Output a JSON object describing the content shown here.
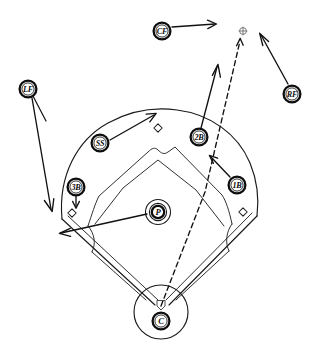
{
  "diagram": {
    "type": "baseball-field-play-diagram",
    "background_color": "#ffffff",
    "ink_color": "#111111",
    "ball_mark_color": "#6e6e6e"
  },
  "players": [
    {
      "id": "lf",
      "label": "LF",
      "x": 28,
      "y": 89,
      "r": 8.4,
      "name": "left-fielder"
    },
    {
      "id": "cf",
      "label": "CF",
      "x": 162,
      "y": 31,
      "r": 8.4,
      "name": "center-fielder"
    },
    {
      "id": "rf",
      "label": "RF",
      "x": 292,
      "y": 94,
      "r": 8.4,
      "name": "right-fielder"
    },
    {
      "id": "ss",
      "label": "SS",
      "x": 100,
      "y": 143,
      "r": 8.4,
      "name": "shortstop"
    },
    {
      "id": "2b",
      "label": "2B",
      "x": 199,
      "y": 137,
      "r": 8.4,
      "name": "second-baseman"
    },
    {
      "id": "3b",
      "label": "3B",
      "x": 76,
      "y": 187,
      "r": 8.4,
      "name": "third-baseman"
    },
    {
      "id": "1b",
      "label": "1B",
      "x": 237,
      "y": 185,
      "r": 8.4,
      "name": "first-baseman"
    },
    {
      "id": "p",
      "label": "P",
      "x": 158,
      "y": 212,
      "r": 8.0,
      "name": "pitcher"
    },
    {
      "id": "c",
      "label": "C",
      "x": 161,
      "y": 321,
      "r": 8.4,
      "name": "catcher"
    }
  ],
  "ball": {
    "label": "batted-ball",
    "x": 243,
    "y": 31,
    "radius": 3.2
  },
  "bases": [
    {
      "id": "second-base",
      "x": 158,
      "y": 128,
      "size": 4.2
    },
    {
      "id": "third-base",
      "x": 72,
      "y": 213,
      "size": 4.2
    },
    {
      "id": "first-base",
      "x": 243,
      "y": 212,
      "size": 4.2
    },
    {
      "id": "home-plate",
      "x": 161,
      "y": 305,
      "size": 4.6
    }
  ],
  "movements": [
    {
      "id": "cf-run",
      "from": "CF",
      "direction": "right",
      "name": "cf-movement-arrow"
    },
    {
      "id": "rf-run",
      "from": "RF",
      "direction": "up-left",
      "name": "rf-movement-arrow"
    },
    {
      "id": "lf-run",
      "from": "LF",
      "direction": "down-left",
      "name": "lf-movement-arrow"
    },
    {
      "id": "ss-run",
      "from": "SS",
      "direction": "up-right",
      "name": "ss-movement-arrow"
    },
    {
      "id": "2b-run",
      "from": "2B",
      "direction": "up",
      "name": "second-baseman-movement-arrow"
    },
    {
      "id": "1b-run",
      "from": "1B",
      "direction": "up-left",
      "name": "first-baseman-movement-arrow"
    },
    {
      "id": "3b-run",
      "from": "3B",
      "direction": "down",
      "name": "third-baseman-movement-arrow"
    },
    {
      "id": "p-run",
      "from": "P",
      "direction": "left",
      "name": "pitcher-movement-arrow"
    }
  ],
  "ball_path": {
    "id": "hit-trajectory",
    "from": "home-plate",
    "to": "batted-ball",
    "style": "dashed"
  }
}
